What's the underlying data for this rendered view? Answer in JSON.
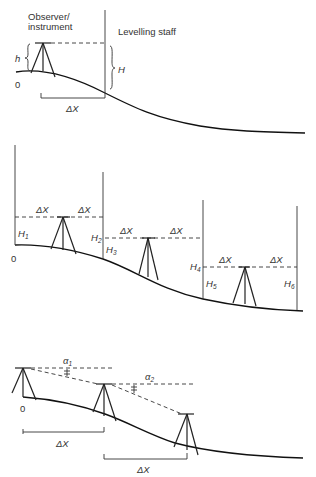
{
  "panel1": {
    "observer_line1": "Observer/",
    "observer_line2": "instrument",
    "staff_label": "Levelling staff",
    "h_label": "h",
    "H_label": "H",
    "origin_label": "0",
    "dx_label": "ΔX"
  },
  "panel2": {
    "origin_label": "0",
    "dx_label": "ΔX",
    "H1": "H",
    "H1_sub": "1",
    "H2": "H",
    "H2_sub": "2",
    "H3": "H",
    "H3_sub": "3",
    "H4": "H",
    "H4_sub": "4",
    "H5": "H",
    "H5_sub": "5",
    "H6": "H",
    "H6_sub": "6"
  },
  "panel3": {
    "origin_label": "0",
    "dx_label": "ΔX",
    "alpha1": "α",
    "alpha1_sub": "1",
    "alpha2": "α",
    "alpha2_sub": "2"
  }
}
